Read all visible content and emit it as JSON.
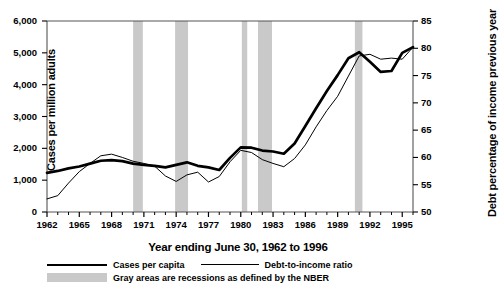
{
  "chart_data": {
    "type": "line",
    "title": "",
    "xlabel": "Year ending June 30, 1962 to 1996",
    "ylabel_left": "Cases per million adults",
    "ylabel_right": "Debt percentage of income previous year",
    "x": [
      1962,
      1963,
      1964,
      1965,
      1966,
      1967,
      1968,
      1969,
      1970,
      1971,
      1972,
      1973,
      1974,
      1975,
      1976,
      1977,
      1978,
      1979,
      1980,
      1981,
      1982,
      1983,
      1984,
      1985,
      1986,
      1987,
      1988,
      1989,
      1990,
      1991,
      1992,
      1993,
      1994,
      1995,
      1996
    ],
    "xlim": [
      1962,
      1996
    ],
    "xticks": [
      1962,
      1965,
      1968,
      1971,
      1974,
      1977,
      1980,
      1983,
      1986,
      1989,
      1992,
      1995
    ],
    "xtick_labels": [
      "1962",
      "1965",
      "1968",
      "1971",
      "1974",
      "1977",
      "1980",
      "1983",
      "1986",
      "1989",
      "1992",
      "1995"
    ],
    "x_minor_ticks_every": 1,
    "ylim_left": [
      0,
      6000
    ],
    "yticks_left": [
      0,
      1000,
      2000,
      3000,
      4000,
      5000,
      6000
    ],
    "ytick_labels_left": [
      "0",
      "1,000",
      "2,000",
      "3,000",
      "4,000",
      "5,000",
      "6,000"
    ],
    "ylim_right": [
      50,
      85
    ],
    "yticks_right": [
      50,
      55,
      60,
      65,
      70,
      75,
      80,
      85
    ],
    "ytick_labels_right": [
      "50",
      "55",
      "60",
      "65",
      "70",
      "75",
      "80",
      "85"
    ],
    "grid": false,
    "legend_position": "below-axes",
    "series": [
      {
        "name": "Cases per capita",
        "axis": "left",
        "style": "thick-solid",
        "color": "#000000",
        "values": [
          1230,
          1290,
          1370,
          1430,
          1520,
          1610,
          1630,
          1600,
          1520,
          1480,
          1450,
          1400,
          1480,
          1560,
          1450,
          1400,
          1320,
          1700,
          2030,
          2020,
          1930,
          1900,
          1830,
          2150,
          2700,
          3260,
          3800,
          4300,
          4830,
          5020,
          4720,
          4400,
          4430,
          5000,
          5180
        ]
      },
      {
        "name": "Debt-to-income ratio",
        "axis": "right",
        "style": "thin-solid",
        "color": "#000000",
        "values": [
          52.4,
          53.0,
          55.3,
          57.4,
          58.9,
          60.3,
          60.6,
          60.0,
          59.3,
          58.9,
          58.4,
          56.6,
          55.6,
          56.8,
          57.3,
          55.5,
          56.5,
          59.2,
          61.3,
          60.9,
          59.6,
          58.9,
          58.3,
          59.8,
          62.3,
          65.6,
          68.6,
          71.2,
          74.9,
          78.6,
          78.9,
          78.0,
          78.2,
          78.0,
          80.2
        ]
      }
    ],
    "shaded_regions": {
      "label": "Gray areas are recessions as defined by the NBER",
      "color": "#c9c9c9",
      "spans": [
        {
          "start": 1970.0,
          "end": 1970.9
        },
        {
          "start": 1973.9,
          "end": 1975.1
        },
        {
          "start": 1980.1,
          "end": 1980.6
        },
        {
          "start": 1981.6,
          "end": 1982.9
        },
        {
          "start": 1990.6,
          "end": 1991.3
        }
      ]
    },
    "legend_entries": [
      {
        "label": "Cases per capita",
        "style": "thick-solid"
      },
      {
        "label": "Debt-to-income ratio",
        "style": "thin-solid"
      },
      {
        "label": "Gray areas are recessions as defined by the NBER",
        "style": "gray-swatch"
      }
    ]
  }
}
